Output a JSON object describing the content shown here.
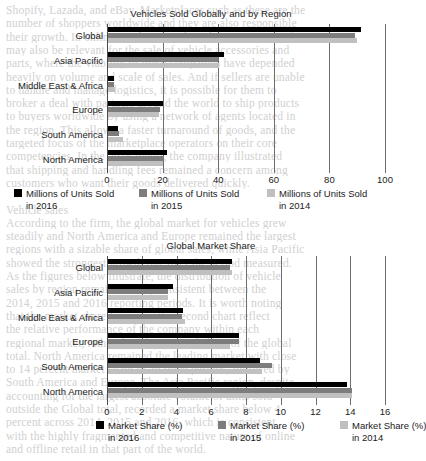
{
  "background_text": [
    "Shopify, Lazada, and eBay. Marketplaces such as these are the",
    "number of shoppers worldwide and they are also responsible",
    "their growth. In online retail, regional markets in Asia Pacific",
    "may also be relevant for the sale of vehicle accessories and",
    "parts, where the viability of these companies have depended",
    "heavily on volume and scale of sales. And if sellers are unable",
    "to handle and manage logistics, it is possible for them to",
    "broker a deal with partners around the world to ship products",
    "to buyers worldwide by using a network of agents located in",
    "the region. This allows a faster turnaround of goods, and the",
    "targeted focus of the marketplace operators on their core",
    "competencies. In the 2016 report, the company illustrated",
    "that shipping and handling fees remained a concern among",
    "customers who want their goods delivered quickly.",
    "",
    "Vehicle sales",
    "According to the firm, the global market for vehicles grew",
    "steadily and North America and Europe remained the largest",
    "regions with a sizable share of global sales, while Asia Pacific",
    "showed the strongest growth rate over the period measured.",
    "As the figures below illustrate, the distribution of vehicle",
    "sales by region remained fairly consistent between the",
    "2014, 2015 and 2016 reporting periods. It is worth noting",
    "that the market share figures in the second chart reflect",
    "the relative performance of the company within each",
    "regional market, rather than the regional share of the global",
    "total. North America remained the leading market with close",
    "to 14 percent market share in all three periods, followed by",
    "South America and Europe. The Asia Pacific region, despite",
    "accounting for the largest absolute volume of units sold",
    "outside the Global total, recorded a market share below 4",
    "percent across 2014, 2015 and 2016, which is consistent",
    "with the highly fragmented and competitive nature of online",
    "and offline retail in that part of the world."
  ],
  "charts": [
    {
      "id": "vehicles-sold",
      "title": "Vehicles Sold Globally and by Region",
      "xaxis": {
        "min": 0,
        "max": 100,
        "ticks": [
          0,
          20,
          40,
          60,
          80,
          100
        ]
      },
      "categories": [
        "Global",
        "Asia Pacific",
        "Middle East & Africa",
        "Europe",
        "South America",
        "North America"
      ],
      "legend": [
        {
          "label_line1": "Millions of Units Sold",
          "label_line2": "in 2016",
          "color": "#000000"
        },
        {
          "label_line1": "Millions of Units Sold",
          "label_line2": "in 2015",
          "color": "#7d7d7d"
        },
        {
          "label_line1": "Millions of Units Sold",
          "label_line2": "in 2014",
          "color": "#c0c0c0"
        }
      ],
      "series": [
        {
          "name": "Millions of Units Sold in 2016",
          "color": "#000000",
          "values": [
            91.3,
            42.0,
            2.6,
            20.0,
            4.0,
            21.5
          ]
        },
        {
          "name": "Millions of Units Sold in 2015",
          "color": "#7d7d7d",
          "values": [
            89.3,
            40.0,
            2.6,
            19.0,
            4.2,
            20.4
          ]
        },
        {
          "name": "Millions of Units Sold in 2014",
          "color": "#c0c0c0",
          "values": [
            89.8,
            40.2,
            3.0,
            18.6,
            5.6,
            20.2
          ]
        }
      ]
    },
    {
      "id": "global-market-share",
      "title": "Global Market Share",
      "xaxis": {
        "min": 0,
        "max": 16,
        "ticks": [
          0,
          2,
          4,
          6,
          8,
          10,
          12,
          14,
          16
        ]
      },
      "categories": [
        "Global",
        "Asia Pacific",
        "Middle East & Africa",
        "Europe",
        "South America",
        "North America"
      ],
      "legend": [
        {
          "label_line1": "Market Share (%)",
          "label_line2": "in 2016",
          "color": "#000000"
        },
        {
          "label_line1": "Market Share (%)",
          "label_line2": "in 2015",
          "color": "#7d7d7d"
        },
        {
          "label_line1": "Market Share (%)",
          "label_line2": "in 2014",
          "color": "#c0c0c0"
        }
      ],
      "series": [
        {
          "name": "Market Share (%) in 2016",
          "color": "#000000",
          "values": [
            7.2,
            3.8,
            4.4,
            7.6,
            8.8,
            13.8
          ]
        },
        {
          "name": "Market Share (%) in 2015",
          "color": "#7d7d7d",
          "values": [
            7.1,
            3.5,
            4.3,
            7.6,
            9.5,
            14.1
          ]
        },
        {
          "name": "Market Share (%) in 2014",
          "color": "#c0c0c0",
          "values": [
            7.2,
            3.5,
            4.5,
            7.1,
            8.9,
            14.1
          ]
        }
      ]
    }
  ],
  "chart_data": [
    {
      "type": "bar",
      "orientation": "horizontal",
      "title": "Vehicles Sold Globally and by Region",
      "xlabel": "",
      "ylabel": "",
      "xlim": [
        0,
        100
      ],
      "xticks": [
        0,
        20,
        40,
        60,
        80,
        100
      ],
      "grid": true,
      "legend_position": "bottom",
      "categories": [
        "Global",
        "Asia Pacific",
        "Middle East & Africa",
        "Europe",
        "South America",
        "North America"
      ],
      "series": [
        {
          "name": "Millions of Units Sold in 2016",
          "values": [
            91.3,
            42.0,
            2.6,
            20.0,
            4.0,
            21.5
          ]
        },
        {
          "name": "Millions of Units Sold in 2015",
          "values": [
            89.3,
            40.0,
            2.6,
            19.0,
            4.2,
            20.4
          ]
        },
        {
          "name": "Millions of Units Sold in 2014",
          "values": [
            89.8,
            40.2,
            3.0,
            18.6,
            5.6,
            20.2
          ]
        }
      ]
    },
    {
      "type": "bar",
      "orientation": "horizontal",
      "title": "Global Market Share",
      "xlabel": "",
      "ylabel": "",
      "xlim": [
        0,
        16
      ],
      "xticks": [
        0,
        2,
        4,
        6,
        8,
        10,
        12,
        14,
        16
      ],
      "grid": true,
      "legend_position": "bottom",
      "categories": [
        "Global",
        "Asia Pacific",
        "Middle East & Africa",
        "Europe",
        "South America",
        "North America"
      ],
      "series": [
        {
          "name": "Market Share (%) in 2016",
          "values": [
            7.2,
            3.8,
            4.4,
            7.6,
            8.8,
            13.8
          ]
        },
        {
          "name": "Market Share (%) in 2015",
          "values": [
            7.1,
            3.5,
            4.3,
            7.6,
            9.5,
            14.1
          ]
        },
        {
          "name": "Market Share (%) in 2014",
          "values": [
            7.2,
            3.5,
            4.5,
            7.1,
            8.9,
            14.1
          ]
        }
      ]
    }
  ]
}
